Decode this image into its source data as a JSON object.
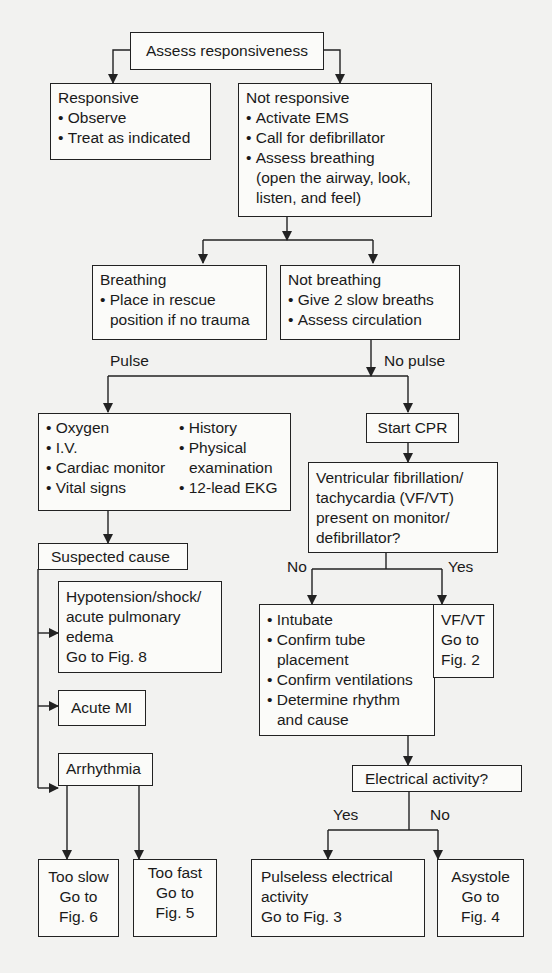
{
  "flowchart": {
    "assess": {
      "title": "Assess responsiveness"
    },
    "responsive": {
      "title": "Responsive",
      "items": [
        "Observe",
        "Treat as indicated"
      ]
    },
    "not_responsive": {
      "title": "Not responsive",
      "items": [
        "Activate EMS",
        "Call for defibrillator",
        "Assess breathing"
      ],
      "note_line1": "(open the airway, look,",
      "note_line2": "listen, and feel)"
    },
    "breathing": {
      "title": "Breathing",
      "item_line1": "Place in rescue",
      "item_line2": "position if no trauma"
    },
    "not_breathing": {
      "title": "Not breathing",
      "items": [
        "Give 2 slow breaths",
        "Assess circulation"
      ]
    },
    "labels": {
      "pulse": "Pulse",
      "no_pulse": "No pulse",
      "no_vf": "No",
      "yes_vf": "Yes",
      "yes_ea": "Yes",
      "no_ea": "No"
    },
    "pulse_actions": {
      "left": [
        "Oxygen",
        "I.V.",
        "Cardiac monitor",
        "Vital signs"
      ],
      "right_1": "History",
      "right_2a": "Physical",
      "right_2b": "examination",
      "right_3": "12-lead EKG"
    },
    "start_cpr": {
      "title": "Start CPR"
    },
    "vf_question": {
      "lines": [
        "Ventricular fibrillation/",
        "tachycardia (VF/VT)",
        "present on monitor/",
        "defibrillator?"
      ]
    },
    "suspected_cause": {
      "title": "Suspected cause"
    },
    "hypotension": {
      "lines": [
        "Hypotension/shock/",
        "acute pulmonary",
        "edema",
        "Go to Fig. 8"
      ]
    },
    "acute_mi": {
      "title": "Acute MI"
    },
    "arrhythmia": {
      "title": "Arrhythmia"
    },
    "intubate": {
      "i1": "Intubate",
      "i2a": "Confirm tube",
      "i2b": "placement",
      "i3": "Confirm ventilations",
      "i4a": "Determine rhythm",
      "i4b": "and cause"
    },
    "vfvt": {
      "lines": [
        "VF/VT",
        "Go to",
        "Fig. 2"
      ]
    },
    "electrical": {
      "title": "Electrical activity?"
    },
    "too_slow": {
      "lines": [
        "Too slow",
        "Go to",
        "Fig. 6"
      ]
    },
    "too_fast": {
      "lines": [
        "Too fast",
        "Go to",
        "Fig. 5"
      ]
    },
    "pea": {
      "lines": [
        "Pulseless electrical",
        "activity",
        "Go to Fig. 3"
      ]
    },
    "asystole": {
      "lines": [
        "Asystole",
        "Go to",
        "Fig. 4"
      ]
    }
  }
}
